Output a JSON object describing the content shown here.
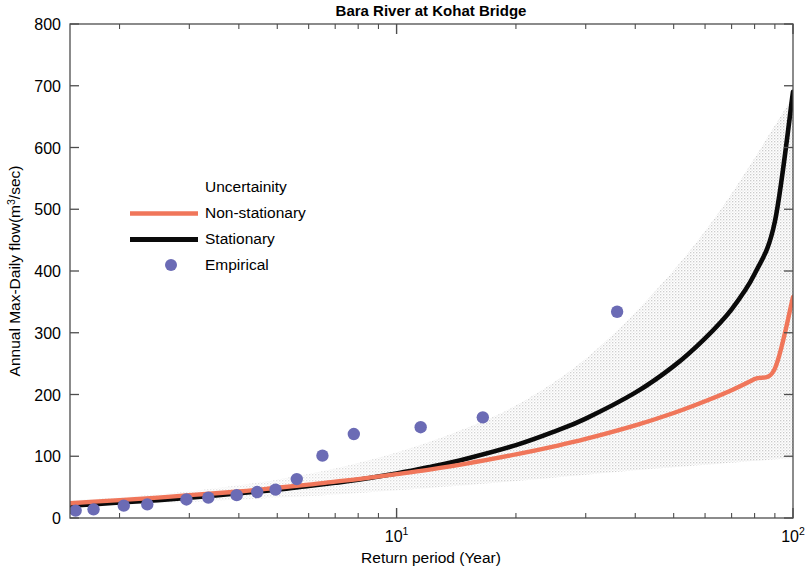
{
  "chart_data": {
    "type": "line",
    "title": "Bara River at Kohat Bridge",
    "xlabel": "Return period (Year)",
    "ylabel": "Annual Max-Daily flow(m³/sec)",
    "ylabel_parts": {
      "pre": "Annual Max-Daily flow(m",
      "sup": "3",
      "post": "/sec)"
    },
    "xscale": "log",
    "yscale": "linear",
    "xlim": [
      1.5,
      100
    ],
    "ylim": [
      0,
      800
    ],
    "grid": false,
    "legend_position": "upper-left-inset",
    "yticks": [
      0,
      100,
      200,
      300,
      400,
      500,
      600,
      700,
      800
    ],
    "ytick_labels": [
      "0",
      "100",
      "200",
      "300",
      "400",
      "500",
      "600",
      "700",
      "800"
    ],
    "xticks": [
      10,
      100
    ],
    "xtick_labels": [
      "10¹",
      "10²"
    ],
    "xtick_label_parts": [
      {
        "base": "10",
        "exp": "1"
      },
      {
        "base": "10",
        "exp": "2"
      }
    ],
    "xminor_ticks": [
      2,
      3,
      4,
      5,
      6,
      7,
      8,
      9,
      20,
      30,
      40,
      50,
      60,
      70,
      80,
      90
    ],
    "colors": {
      "non_stationary": "#F0765A",
      "stationary": "#0A0A0A",
      "empirical": "#6B6BB5",
      "uncertainty": "#CFCFCF",
      "axis": "#4D4D4D",
      "background": "#FFFFFF"
    },
    "series": [
      {
        "name": "Uncertainity",
        "type": "band",
        "style": "stippled-gray-fan",
        "x": [
          1.5,
          2,
          3,
          4,
          5,
          7,
          10,
          14,
          20,
          30,
          45,
          65,
          100
        ],
        "lower": [
          20,
          22,
          26,
          30,
          33,
          38,
          45,
          52,
          60,
          70,
          80,
          88,
          97
        ],
        "upper": [
          28,
          33,
          43,
          53,
          62,
          80,
          106,
          138,
          182,
          258,
          368,
          495,
          682
        ]
      },
      {
        "name": "Non-stationary",
        "type": "line",
        "x": [
          1.5,
          2,
          2.5,
          3,
          4,
          5,
          6,
          7,
          8,
          10,
          12,
          15,
          20,
          25,
          30,
          40,
          50,
          60,
          70,
          80,
          90,
          100
        ],
        "values": [
          24,
          29,
          33,
          37,
          43,
          49,
          54,
          59,
          63,
          71,
          78,
          88,
          103,
          116,
          128,
          150,
          170,
          189,
          207,
          225,
          242,
          358
        ]
      },
      {
        "name": "Stationary",
        "type": "line",
        "x": [
          1.5,
          2,
          2.5,
          3,
          4,
          5,
          6,
          7,
          8,
          10,
          12,
          15,
          20,
          25,
          30,
          40,
          50,
          60,
          70,
          80,
          90,
          100
        ],
        "values": [
          20,
          25,
          29,
          33,
          40,
          46,
          52,
          57,
          62,
          72,
          82,
          96,
          118,
          140,
          161,
          203,
          246,
          291,
          338,
          395,
          480,
          690
        ]
      },
      {
        "name": "Empirical",
        "type": "scatter",
        "points": [
          {
            "x": 1.55,
            "y": 12
          },
          {
            "x": 1.72,
            "y": 14
          },
          {
            "x": 2.05,
            "y": 20
          },
          {
            "x": 2.35,
            "y": 22
          },
          {
            "x": 2.95,
            "y": 30
          },
          {
            "x": 3.35,
            "y": 33
          },
          {
            "x": 3.95,
            "y": 37
          },
          {
            "x": 4.45,
            "y": 42
          },
          {
            "x": 4.95,
            "y": 46
          },
          {
            "x": 5.6,
            "y": 63
          },
          {
            "x": 6.5,
            "y": 101
          },
          {
            "x": 7.8,
            "y": 136
          },
          {
            "x": 11.5,
            "y": 147
          },
          {
            "x": 16.5,
            "y": 163
          },
          {
            "x": 36,
            "y": 334
          }
        ]
      }
    ],
    "legend_entries": [
      {
        "label": "Uncertainity",
        "marker": "none",
        "color": "#CFCFCF"
      },
      {
        "label": "Non-stationary",
        "marker": "line",
        "color": "#F0765A"
      },
      {
        "label": "Stationary",
        "marker": "line",
        "color": "#0A0A0A"
      },
      {
        "label": "Empirical",
        "marker": "dot",
        "color": "#6B6BB5"
      }
    ]
  }
}
